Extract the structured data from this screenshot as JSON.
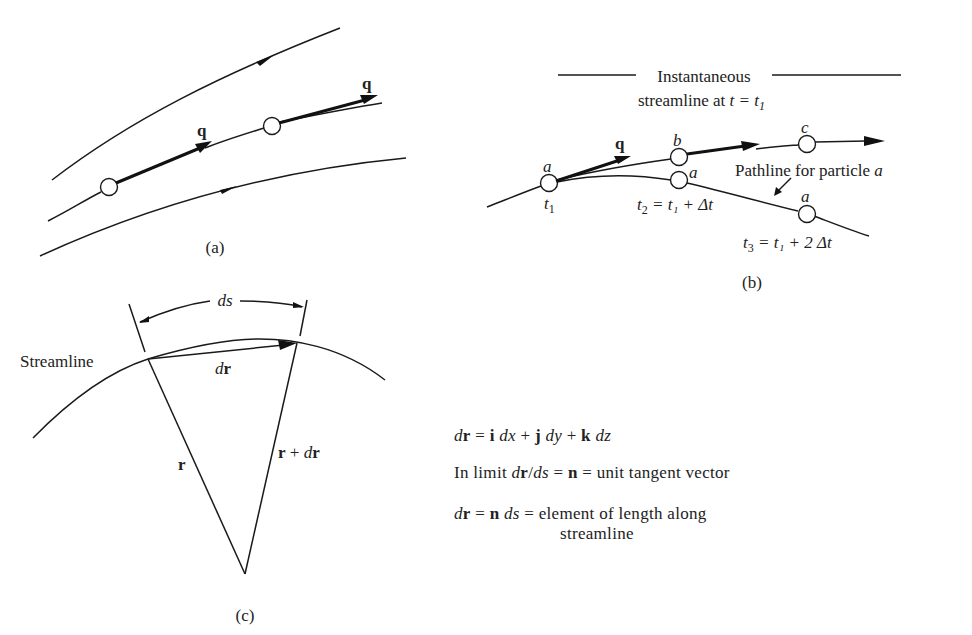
{
  "figure": {
    "panel_a": {
      "caption": "(a)",
      "labels": {
        "q_left": "q",
        "q_right": "q"
      }
    },
    "panel_b": {
      "caption": "(b)",
      "title_line1": "Instantaneous",
      "title_line2_text": "streamline at ",
      "title_line2_math": "t = t",
      "title_line2_sub": "1",
      "q_label": "q",
      "particles": [
        {
          "name": "a",
          "time_label": "t",
          "time_sub": "1",
          "time_rest": ""
        },
        {
          "name": "b"
        },
        {
          "name": "c"
        },
        {
          "name": "a",
          "time_label": "t",
          "time_sub": "2",
          "time_rest": " = t₁ + Δt"
        },
        {
          "name": "a",
          "time_label": "t",
          "time_sub": "3",
          "time_rest": " = t₁ + 2 Δt"
        }
      ],
      "pathline_label_text": "Pathline for particle ",
      "pathline_label_var": "a"
    },
    "panel_c": {
      "caption": "(c)",
      "streamline_label": "Streamline",
      "ds_label": "ds",
      "dr_label_d": "d",
      "dr_label_r": "r",
      "r_label": "r",
      "r_plus_dr_r": "r",
      "r_plus_dr_op": " + ",
      "r_plus_dr_d": "d",
      "r_plus_dr_r2": "r"
    },
    "equations": {
      "eq1": {
        "lhs_d": "d",
        "lhs_r": "r",
        "eq": " = ",
        "i": "i",
        "dx": " dx",
        "plus1": " + ",
        "j": "j",
        "dy": " dy",
        "plus2": " + ",
        "k": "k",
        "dz": " dz"
      },
      "eq2": {
        "prefix": "In limit ",
        "d1": "d",
        "r": "r",
        "slash": "/",
        "ds": "ds",
        "eq1": " = ",
        "n": "n",
        "eq2": " = ",
        "suffix": "unit tangent vector"
      },
      "eq3": {
        "d": "d",
        "r": "r",
        "eq1": " = ",
        "n": "n",
        "ds": " ds",
        "eq2": " = ",
        "line1": "element of length along",
        "line2": "streamline"
      }
    }
  }
}
